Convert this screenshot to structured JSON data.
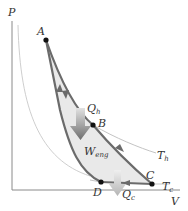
{
  "diagram": {
    "axes": {
      "y_label": "P",
      "x_label": "V"
    },
    "points": [
      {
        "name": "A",
        "label": "A"
      },
      {
        "name": "B",
        "label": "B"
      },
      {
        "name": "C",
        "label": "C"
      },
      {
        "name": "D",
        "label": "D"
      }
    ],
    "isotherms": {
      "hot": {
        "label": "T",
        "sub": "h"
      },
      "cold": {
        "label": "T",
        "sub": "c"
      }
    },
    "heat": {
      "in": {
        "label": "Q",
        "sub": "h"
      },
      "out": {
        "label": "Q",
        "sub": "c"
      }
    },
    "work": {
      "label": "W",
      "sub": "eng"
    },
    "colors": {
      "cycle_path": "#6b6b6b",
      "isotherm": "#b8b8b8",
      "enclosed_area": "#e9e9e9",
      "arrow_gradient_top": "#e0e0e0",
      "arrow_gradient_bottom": "#707070",
      "axes": "#8a8a8a",
      "point": "#111111"
    }
  }
}
